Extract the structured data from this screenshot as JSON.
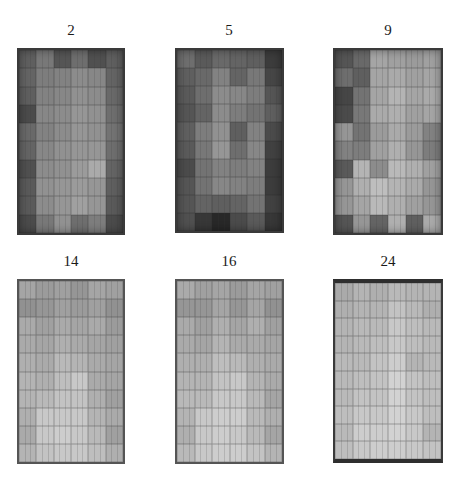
{
  "figure": {
    "panels": [
      {
        "label": "2",
        "label_pos": {
          "x": 41,
          "y": 22
        },
        "box": {
          "x": 17,
          "y": 48,
          "w": 108,
          "h": 187
        },
        "style": "dark",
        "cells": [
          [
            95,
            120,
            85,
            110,
            80,
            95
          ],
          [
            100,
            125,
            130,
            140,
            135,
            100
          ],
          [
            95,
            130,
            135,
            145,
            140,
            105
          ],
          [
            75,
            135,
            140,
            150,
            145,
            110
          ],
          [
            105,
            130,
            140,
            150,
            145,
            115
          ],
          [
            100,
            135,
            145,
            150,
            150,
            110
          ],
          [
            80,
            140,
            145,
            155,
            170,
            100
          ],
          [
            90,
            145,
            150,
            155,
            150,
            95
          ],
          [
            90,
            140,
            150,
            160,
            150,
            90
          ],
          [
            75,
            120,
            145,
            110,
            125,
            75
          ]
        ]
      },
      {
        "label": "5",
        "label_pos": {
          "x": 199,
          "y": 22
        },
        "box": {
          "x": 175,
          "y": 48,
          "w": 109,
          "h": 185
        },
        "style": "dark",
        "cells": [
          [
            110,
            90,
            105,
            100,
            95,
            60
          ],
          [
            95,
            105,
            130,
            100,
            120,
            70
          ],
          [
            90,
            110,
            140,
            135,
            125,
            85
          ],
          [
            85,
            100,
            140,
            125,
            115,
            95
          ],
          [
            95,
            125,
            145,
            95,
            130,
            75
          ],
          [
            90,
            120,
            150,
            110,
            135,
            65
          ],
          [
            75,
            115,
            130,
            125,
            130,
            60
          ],
          [
            85,
            115,
            135,
            130,
            125,
            60
          ],
          [
            85,
            100,
            95,
            100,
            115,
            65
          ],
          [
            80,
            55,
            40,
            75,
            90,
            55
          ]
        ]
      },
      {
        "label": "9",
        "label_pos": {
          "x": 358,
          "y": 22
        },
        "box": {
          "x": 333,
          "y": 48,
          "w": 110,
          "h": 187
        },
        "style": "dark",
        "cells": [
          [
            85,
            105,
            165,
            160,
            155,
            160
          ],
          [
            110,
            95,
            165,
            170,
            160,
            165
          ],
          [
            70,
            115,
            165,
            180,
            165,
            170
          ],
          [
            75,
            120,
            170,
            175,
            160,
            165
          ],
          [
            150,
            115,
            155,
            170,
            155,
            130
          ],
          [
            130,
            125,
            160,
            175,
            150,
            125
          ],
          [
            90,
            180,
            140,
            185,
            175,
            160
          ],
          [
            150,
            175,
            190,
            180,
            170,
            150
          ],
          [
            150,
            165,
            185,
            175,
            160,
            150
          ],
          [
            85,
            150,
            100,
            175,
            95,
            170
          ]
        ]
      },
      {
        "label": "14",
        "label_pos": {
          "x": 41,
          "y": 253
        },
        "box": {
          "x": 17,
          "y": 279,
          "w": 108,
          "h": 185
        },
        "style": "light",
        "cells": [
          [
            165,
            155,
            160,
            150,
            165,
            160
          ],
          [
            145,
            150,
            160,
            155,
            160,
            145
          ],
          [
            170,
            160,
            170,
            165,
            170,
            155
          ],
          [
            170,
            165,
            175,
            170,
            165,
            160
          ],
          [
            175,
            170,
            185,
            180,
            170,
            165
          ],
          [
            180,
            175,
            190,
            200,
            170,
            165
          ],
          [
            180,
            185,
            195,
            195,
            175,
            160
          ],
          [
            175,
            200,
            200,
            200,
            180,
            170
          ],
          [
            170,
            200,
            205,
            200,
            185,
            160
          ],
          [
            180,
            195,
            200,
            200,
            190,
            175
          ]
        ]
      },
      {
        "label": "16",
        "label_pos": {
          "x": 199,
          "y": 253
        },
        "box": {
          "x": 175,
          "y": 279,
          "w": 109,
          "h": 185
        },
        "style": "light",
        "cells": [
          [
            170,
            160,
            165,
            155,
            165,
            160
          ],
          [
            150,
            150,
            165,
            150,
            165,
            145
          ],
          [
            170,
            160,
            175,
            165,
            175,
            160
          ],
          [
            170,
            165,
            180,
            170,
            170,
            165
          ],
          [
            175,
            175,
            190,
            185,
            175,
            170
          ],
          [
            180,
            180,
            195,
            200,
            180,
            170
          ],
          [
            185,
            185,
            200,
            200,
            185,
            165
          ],
          [
            180,
            200,
            205,
            205,
            185,
            175
          ],
          [
            175,
            200,
            205,
            200,
            185,
            165
          ],
          [
            185,
            200,
            205,
            205,
            195,
            180
          ]
        ]
      },
      {
        "label": "24",
        "label_pos": {
          "x": 358,
          "y": 253
        },
        "box": {
          "x": 333,
          "y": 279,
          "w": 110,
          "h": 184
        },
        "style": "light-framed",
        "cells": [
          [
            170,
            180,
            175,
            185,
            180,
            180
          ],
          [
            175,
            180,
            180,
            195,
            185,
            175
          ],
          [
            180,
            185,
            185,
            200,
            190,
            185
          ],
          [
            180,
            185,
            190,
            200,
            190,
            185
          ],
          [
            185,
            185,
            195,
            205,
            180,
            185
          ],
          [
            185,
            190,
            195,
            210,
            195,
            190
          ],
          [
            185,
            195,
            195,
            210,
            195,
            190
          ],
          [
            190,
            200,
            200,
            210,
            200,
            190
          ],
          [
            185,
            205,
            205,
            210,
            200,
            180
          ],
          [
            190,
            200,
            205,
            205,
            200,
            195
          ]
        ]
      }
    ]
  }
}
